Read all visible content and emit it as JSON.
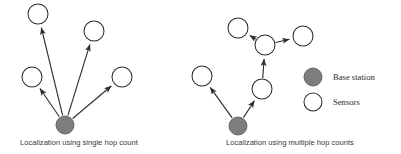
{
  "figure": {
    "width": 401,
    "height": 154,
    "background": "#ffffff"
  },
  "colors": {
    "base_station_fill": "#7d7d7d",
    "base_station_stroke": "#5d5d5d",
    "sensor_fill": "#ffffff",
    "node_stroke": "#2e2e2e",
    "link_stroke": "#2e2e2e",
    "caption_text": "#3a3a3a",
    "legend_text": "#2b2b2b"
  },
  "panels": [
    {
      "id": "single-hop",
      "caption": "Localization using single hop count",
      "caption_x": 20,
      "caption_y": 145,
      "nodes": [
        {
          "id": "s1",
          "type": "sensor",
          "cx": 38,
          "cy": 14,
          "r": 10
        },
        {
          "id": "s2",
          "type": "sensor",
          "cx": 94,
          "cy": 31,
          "r": 10
        },
        {
          "id": "s3",
          "type": "sensor",
          "cx": 32,
          "cy": 77,
          "r": 10
        },
        {
          "id": "s4",
          "type": "sensor",
          "cx": 122,
          "cy": 77,
          "r": 10
        },
        {
          "id": "bs",
          "type": "base",
          "cx": 65,
          "cy": 125,
          "r": 9
        }
      ],
      "links": [
        {
          "from": "bs",
          "to": "s1",
          "arrow": "to"
        },
        {
          "from": "bs",
          "to": "s2",
          "arrow": "to"
        },
        {
          "from": "bs",
          "to": "s3",
          "arrow": "to"
        },
        {
          "from": "bs",
          "to": "s4",
          "arrow": "to"
        }
      ]
    },
    {
      "id": "multi-hop",
      "caption": "Localization using multiple hop counts",
      "caption_x": 226,
      "caption_y": 145,
      "nodes": [
        {
          "id": "m1",
          "type": "sensor",
          "cx": 238,
          "cy": 28,
          "r": 10
        },
        {
          "id": "hub",
          "type": "sensor",
          "cx": 265,
          "cy": 45,
          "r": 10
        },
        {
          "id": "m3",
          "type": "sensor",
          "cx": 303,
          "cy": 36,
          "r": 10
        },
        {
          "id": "m4",
          "type": "sensor",
          "cx": 262,
          "cy": 89,
          "r": 10
        },
        {
          "id": "m5",
          "type": "sensor",
          "cx": 202,
          "cy": 76,
          "r": 10
        },
        {
          "id": "bs2",
          "type": "base",
          "cx": 238,
          "cy": 126,
          "r": 9
        }
      ],
      "links": [
        {
          "from": "bs2",
          "to": "m5",
          "arrow": "to"
        },
        {
          "from": "bs2",
          "to": "m4",
          "arrow": "to"
        },
        {
          "from": "m4",
          "to": "hub",
          "arrow": "to"
        },
        {
          "from": "hub",
          "to": "m1",
          "arrow": "to"
        },
        {
          "from": "hub",
          "to": "m3",
          "arrow": "to"
        }
      ]
    }
  ],
  "legend": {
    "items": [
      {
        "id": "base-station",
        "label": "Base station",
        "marker": "filled-circle",
        "cx": 313,
        "cy": 77,
        "r": 9,
        "label_x": 333,
        "label_y": 80
      },
      {
        "id": "sensors",
        "label": "Sensors",
        "marker": "hollow-circle",
        "cx": 313,
        "cy": 102,
        "r": 9,
        "label_x": 333,
        "label_y": 105
      }
    ]
  }
}
